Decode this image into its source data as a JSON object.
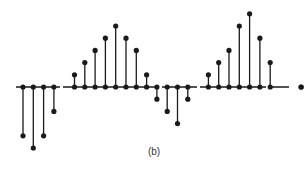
{
  "chart_data": {
    "type": "stem",
    "title": "",
    "caption": "(b)",
    "xlabel": "",
    "ylabel": "",
    "grid": false,
    "axis_visible": "horizontal baseline only",
    "color": "#1a1a1a",
    "x": [
      0,
      1,
      2,
      3,
      5,
      6,
      7,
      8,
      9,
      10,
      11,
      12,
      13,
      14,
      15,
      16,
      18,
      19,
      20,
      21,
      22,
      23,
      24,
      25,
      26,
      27,
      28
    ],
    "values": [
      -4,
      -5,
      -4,
      -2,
      1,
      2,
      3,
      4,
      5,
      4,
      3,
      1,
      -1,
      -2,
      -3,
      -1,
      1,
      2,
      3,
      5,
      6,
      4,
      2,
      0,
      0,
      0,
      -2
    ],
    "note": "stems at x=25,26 absent; x=28 final negative stem",
    "ylim": [
      -5,
      6
    ]
  }
}
